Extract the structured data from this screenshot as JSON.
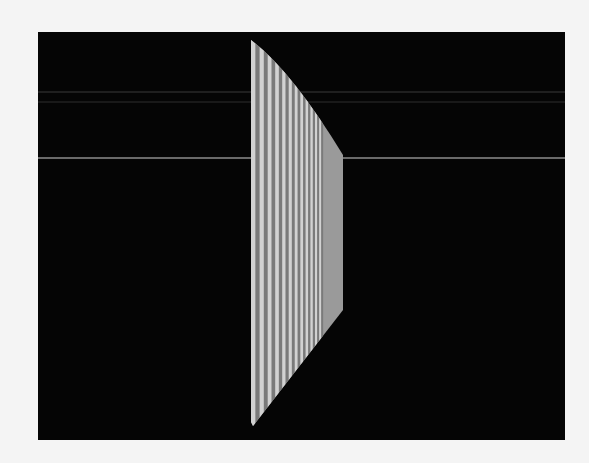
{
  "figure": {
    "background_color": "#f4f4f4",
    "frame_color": "#050505",
    "frame": {
      "x": 38,
      "y": 32,
      "width": 527,
      "height": 408
    },
    "horizontal_lines": [
      {
        "y": 92,
        "color": "#3a3a3a",
        "width": 1
      },
      {
        "y": 102,
        "color": "#2e2e2e",
        "width": 1
      },
      {
        "y": 158,
        "color": "#6a6a6a",
        "width": 2
      }
    ],
    "shape": {
      "left_x": 251,
      "right_x": 343,
      "top_y": 40,
      "right_top_y": 155,
      "right_bottom_y": 310,
      "bottom_y": 426,
      "stripe_light": "#d2d2d2",
      "stripe_dark": "#7a7a7a",
      "flat_fill": "#9a9a9a"
    }
  }
}
